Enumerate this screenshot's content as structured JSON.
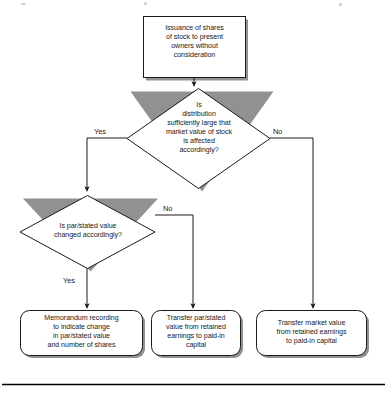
{
  "diagram": {
    "type": "flowchart",
    "title_visible": false,
    "colors": {
      "stroke": "#1a1a1a",
      "fill": "#ffffff",
      "shadow": "#8c8c8c",
      "text": "#1a1a1a",
      "rule": "#000000"
    },
    "nodes": [
      {
        "id": "start",
        "shape": "rectangle",
        "text": "Issuance of shares\nof stock to present\nowners without\nconsideration"
      },
      {
        "id": "decision1",
        "shape": "diamond",
        "text": "Is\ndistribution\nsufficiently large that\nmarket value of stock\nis affected\naccordingly?"
      },
      {
        "id": "decision2",
        "shape": "diamond",
        "text": "Is par/stated value\nchanged accordingly?"
      },
      {
        "id": "outcome1",
        "shape": "rounded-rectangle",
        "text": "Memorandum recording\nto indicate change\nin par/stated value\nand number of shares"
      },
      {
        "id": "outcome2",
        "shape": "rounded-rectangle",
        "text": "Transfer par/stated\nvalue from retained\nearnings to paid-in\ncapital"
      },
      {
        "id": "outcome3",
        "shape": "rounded-rectangle",
        "text": "Transfer market value\nfrom retained earnings\nto paid-in capital"
      }
    ],
    "edges": [
      {
        "id": "start-to-d1",
        "from": "start",
        "to": "decision1",
        "label": ""
      },
      {
        "id": "d1-yes",
        "from": "decision1",
        "to": "decision2",
        "label": "Yes"
      },
      {
        "id": "d1-no",
        "from": "decision1",
        "to": "outcome3",
        "label": "No"
      },
      {
        "id": "d2-yes",
        "from": "decision2",
        "to": "outcome1",
        "label": "Yes"
      },
      {
        "id": "d2-no",
        "from": "decision2",
        "to": "outcome2",
        "label": "No"
      }
    ]
  }
}
